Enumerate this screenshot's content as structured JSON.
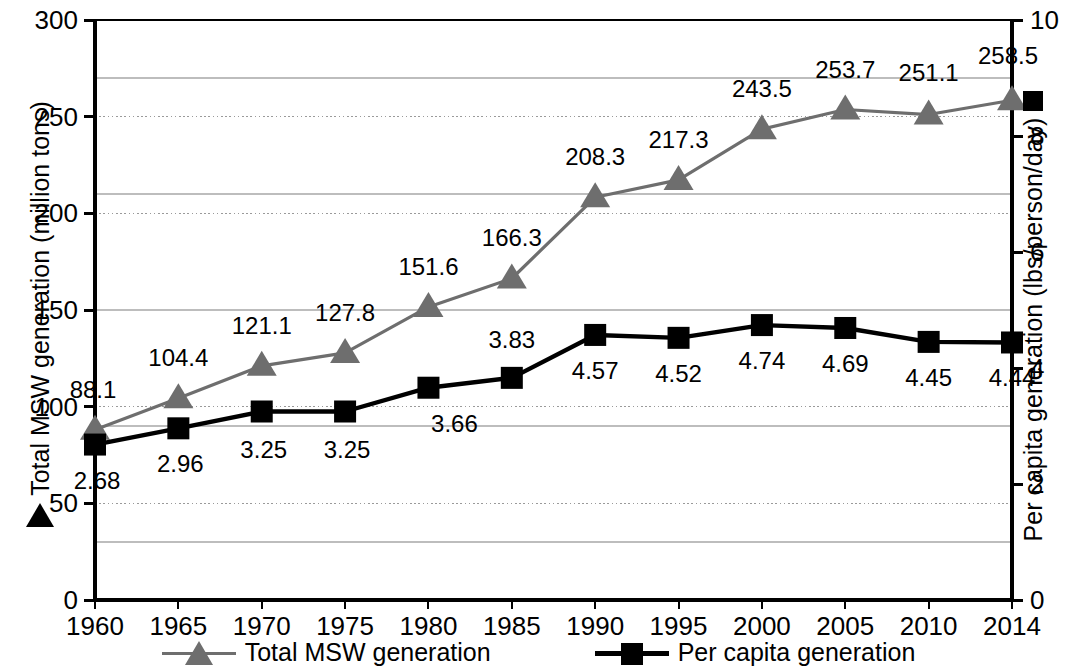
{
  "chart_data": {
    "type": "line",
    "title": "",
    "subtitle": "",
    "xlabel": "",
    "ylabel": "Total MSW generation (million tons)",
    "y2label": "Per capita generation (lbs/person/day)",
    "grid": true,
    "legend_position": "bottom",
    "x": [
      1960,
      1965,
      1970,
      1975,
      1980,
      1985,
      1990,
      1995,
      2000,
      2005,
      2010,
      2014
    ],
    "categories": [
      "1960",
      "1965",
      "1970",
      "1975",
      "1980",
      "1985",
      "1990",
      "1995",
      "2000",
      "2005",
      "2010",
      "2014"
    ],
    "ylim": [
      0,
      300
    ],
    "yticks": [
      "0",
      "50",
      "100",
      "150",
      "200",
      "250",
      "300"
    ],
    "ytick_values": [
      0,
      50,
      100,
      150,
      200,
      250,
      300
    ],
    "y2lim": [
      0,
      10
    ],
    "y2ticks": [
      "0",
      "2",
      "4",
      "6",
      "8",
      "10"
    ],
    "y2tick_values": [
      0,
      2,
      4,
      6,
      8,
      10
    ],
    "series": [
      {
        "name": "Total MSW generation",
        "axis": "left",
        "marker": "triangle",
        "color": "#6e6e6e",
        "values": [
          88.1,
          104.4,
          121.1,
          127.8,
          151.6,
          166.3,
          208.3,
          217.3,
          243.5,
          253.7,
          251.1,
          258.5
        ],
        "labels": [
          "88.1",
          "104.4",
          "121.1",
          "127.8",
          "151.6",
          "166.3",
          "208.3",
          "217.3",
          "243.5",
          "253.7",
          "251.1",
          "258.5"
        ]
      },
      {
        "name": "Per capita generation",
        "axis": "right",
        "marker": "square",
        "color": "#000000",
        "values": [
          2.68,
          2.96,
          3.25,
          3.25,
          3.66,
          3.83,
          4.57,
          4.52,
          4.74,
          4.69,
          4.45,
          4.44
        ],
        "labels": [
          "2.68",
          "2.96",
          "3.25",
          "3.25",
          "3.66",
          "3.83",
          "4.57",
          "4.52",
          "4.74",
          "4.69",
          "4.45",
          "4.44"
        ]
      }
    ]
  },
  "axes": {
    "left_title": "Total MSW generation (million tons)",
    "right_title": "Per capita generation (lbs/person/day)",
    "left_ticks": [
      "300",
      "250",
      "200",
      "150",
      "100",
      "50",
      "0"
    ],
    "right_ticks": [
      "10",
      "8",
      "6",
      "4",
      "2",
      "0"
    ],
    "x_ticks": [
      "1960",
      "1965",
      "1970",
      "1975",
      "1980",
      "1985",
      "1990",
      "1995",
      "2000",
      "2005",
      "2010",
      "2014"
    ]
  },
  "data_labels": {
    "total": [
      "88.1",
      "104.4",
      "121.1",
      "127.8",
      "151.6",
      "166.3",
      "208.3",
      "217.3",
      "243.5",
      "253.7",
      "251.1",
      "258.5"
    ],
    "capita": [
      "2.68",
      "2.96",
      "3.25",
      "3.25",
      "3.66",
      "3.83",
      "4.57",
      "4.52",
      "4.74",
      "4.69",
      "4.45",
      "4.44"
    ]
  },
  "legend": {
    "items": [
      {
        "label": "Total MSW generation",
        "marker": "triangle-icon",
        "color": "#6e6e6e"
      },
      {
        "label": "Per capita generation",
        "marker": "square-icon",
        "color": "#000000"
      }
    ]
  },
  "colors": {
    "total_series": "#6e6e6e",
    "capita_series": "#000000",
    "axis": "#000000",
    "gridline": "#9a9a9a",
    "background": "#ffffff"
  }
}
